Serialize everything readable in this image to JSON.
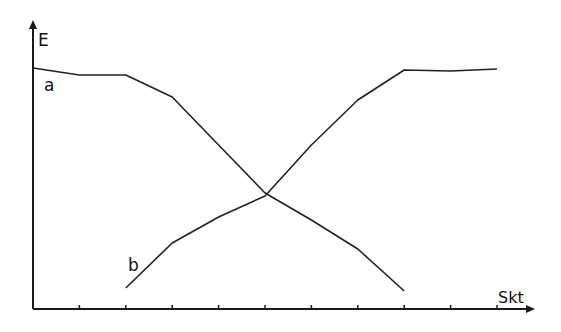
{
  "chart_data": {
    "type": "line",
    "title": "",
    "xlabel": "Skt",
    "ylabel": "E",
    "x_ticks": [
      1,
      2,
      3,
      4,
      5,
      6,
      7,
      8,
      9,
      10
    ],
    "tick_labels_shown": false,
    "xlim": [
      0,
      10.8
    ],
    "ylim": [
      0,
      27
    ],
    "grid": false,
    "legend": "inline labels",
    "series": [
      {
        "name": "a",
        "x": [
          0,
          1,
          2,
          3,
          4,
          5,
          6,
          7,
          8
        ],
        "y": [
          24.1,
          23.4,
          23.4,
          21.2,
          16.4,
          11.6,
          8.9,
          6.0,
          1.8
        ]
      },
      {
        "name": "b",
        "x": [
          2,
          3,
          4,
          5,
          6,
          7,
          8,
          9,
          10
        ],
        "y": [
          2.1,
          6.6,
          9.2,
          11.3,
          16.4,
          20.9,
          23.9,
          23.8,
          24.0
        ]
      }
    ],
    "annotations": [
      {
        "text": "a",
        "near_series": "a"
      },
      {
        "text": "b",
        "near_series": "b"
      }
    ]
  },
  "labels": {
    "y_axis": "E",
    "x_axis": "Skt",
    "series_a": "a",
    "series_b": "b"
  }
}
